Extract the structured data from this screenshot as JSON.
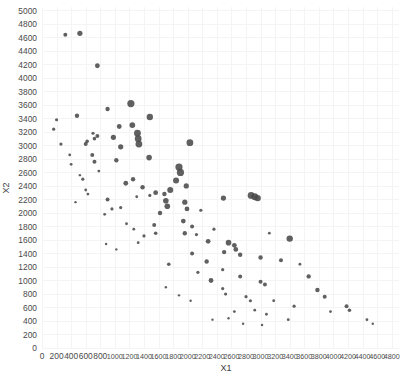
{
  "chart_data": {
    "type": "scatter",
    "title": "",
    "xlabel": "X1",
    "ylabel": "X2",
    "xlim": [
      0,
      4900
    ],
    "ylim": [
      0,
      5050
    ],
    "grid": true,
    "legend": "none",
    "marker_color": "#4a4a4a",
    "background": "#ffffff",
    "gridline_color": "#f4f4f6",
    "xticks": [
      0,
      200,
      400,
      600,
      800,
      1000,
      1200,
      1400,
      1600,
      1800,
      2000,
      2200,
      2400,
      2600,
      2800,
      3000,
      3200,
      3400,
      3600,
      3800,
      4000,
      4200,
      4400,
      4600,
      4800
    ],
    "yticks": [
      0,
      200,
      400,
      600,
      800,
      1000,
      1200,
      1400,
      1600,
      1800,
      2000,
      2200,
      2400,
      2600,
      2800,
      3000,
      3200,
      3400,
      3600,
      3800,
      4000,
      4200,
      4400,
      4600,
      4800,
      5000
    ],
    "points": [
      {
        "x": 320,
        "y": 4640,
        "s": 2.0
      },
      {
        "x": 520,
        "y": 4660,
        "s": 2.6
      },
      {
        "x": 760,
        "y": 4180,
        "s": 2.4
      },
      {
        "x": 200,
        "y": 3380,
        "s": 1.6
      },
      {
        "x": 480,
        "y": 3440,
        "s": 2.2
      },
      {
        "x": 160,
        "y": 3240,
        "s": 1.6
      },
      {
        "x": 260,
        "y": 3020,
        "s": 1.6
      },
      {
        "x": 600,
        "y": 3020,
        "s": 2.0
      },
      {
        "x": 690,
        "y": 2860,
        "s": 2.0
      },
      {
        "x": 720,
        "y": 2760,
        "s": 2.0
      },
      {
        "x": 900,
        "y": 3540,
        "s": 2.2
      },
      {
        "x": 1060,
        "y": 3280,
        "s": 2.4
      },
      {
        "x": 1220,
        "y": 3620,
        "s": 3.6
      },
      {
        "x": 1240,
        "y": 3300,
        "s": 2.8
      },
      {
        "x": 1480,
        "y": 3420,
        "s": 3.2
      },
      {
        "x": 700,
        "y": 3180,
        "s": 1.6
      },
      {
        "x": 760,
        "y": 3140,
        "s": 2.0
      },
      {
        "x": 720,
        "y": 3100,
        "s": 1.8
      },
      {
        "x": 620,
        "y": 3060,
        "s": 1.8
      },
      {
        "x": 980,
        "y": 3120,
        "s": 2.6
      },
      {
        "x": 1080,
        "y": 2980,
        "s": 2.6
      },
      {
        "x": 1310,
        "y": 3180,
        "s": 3.4
      },
      {
        "x": 1320,
        "y": 3100,
        "s": 3.4
      },
      {
        "x": 1330,
        "y": 3020,
        "s": 3.4
      },
      {
        "x": 1470,
        "y": 2820,
        "s": 2.8
      },
      {
        "x": 2030,
        "y": 3040,
        "s": 3.4
      },
      {
        "x": 1020,
        "y": 2780,
        "s": 2.2
      },
      {
        "x": 380,
        "y": 2860,
        "s": 1.4
      },
      {
        "x": 400,
        "y": 2720,
        "s": 1.4
      },
      {
        "x": 560,
        "y": 2500,
        "s": 1.6
      },
      {
        "x": 600,
        "y": 2340,
        "s": 1.4
      },
      {
        "x": 630,
        "y": 2280,
        "s": 1.4
      },
      {
        "x": 1150,
        "y": 2440,
        "s": 2.4
      },
      {
        "x": 1250,
        "y": 2500,
        "s": 2.2
      },
      {
        "x": 1380,
        "y": 2380,
        "s": 2.2
      },
      {
        "x": 1560,
        "y": 2300,
        "s": 2.4
      },
      {
        "x": 1680,
        "y": 2280,
        "s": 2.2
      },
      {
        "x": 900,
        "y": 2200,
        "s": 2.0
      },
      {
        "x": 1080,
        "y": 2080,
        "s": 1.6
      },
      {
        "x": 860,
        "y": 1980,
        "s": 1.4
      },
      {
        "x": 960,
        "y": 2060,
        "s": 1.6
      },
      {
        "x": 1880,
        "y": 2680,
        "s": 3.6
      },
      {
        "x": 1900,
        "y": 2600,
        "s": 3.6
      },
      {
        "x": 1840,
        "y": 2480,
        "s": 3.0
      },
      {
        "x": 1760,
        "y": 2340,
        "s": 3.0
      },
      {
        "x": 1980,
        "y": 2400,
        "s": 2.6
      },
      {
        "x": 1700,
        "y": 2180,
        "s": 2.8
      },
      {
        "x": 1720,
        "y": 2100,
        "s": 2.8
      },
      {
        "x": 1960,
        "y": 2160,
        "s": 2.6
      },
      {
        "x": 1990,
        "y": 2060,
        "s": 2.4
      },
      {
        "x": 1620,
        "y": 2000,
        "s": 2.2
      },
      {
        "x": 1940,
        "y": 1880,
        "s": 2.4
      },
      {
        "x": 2060,
        "y": 1800,
        "s": 2.0
      },
      {
        "x": 1960,
        "y": 1700,
        "s": 2.2
      },
      {
        "x": 1540,
        "y": 1820,
        "s": 2.0
      },
      {
        "x": 1560,
        "y": 1700,
        "s": 1.8
      },
      {
        "x": 1400,
        "y": 1660,
        "s": 1.6
      },
      {
        "x": 2870,
        "y": 2260,
        "s": 3.4
      },
      {
        "x": 2920,
        "y": 2240,
        "s": 3.4
      },
      {
        "x": 2960,
        "y": 2220,
        "s": 3.2
      },
      {
        "x": 2490,
        "y": 2220,
        "s": 2.6
      },
      {
        "x": 3400,
        "y": 1620,
        "s": 3.2
      },
      {
        "x": 2560,
        "y": 1560,
        "s": 2.8
      },
      {
        "x": 2640,
        "y": 1520,
        "s": 2.4
      },
      {
        "x": 2660,
        "y": 1460,
        "s": 2.4
      },
      {
        "x": 2280,
        "y": 1580,
        "s": 2.4
      },
      {
        "x": 2500,
        "y": 1420,
        "s": 2.2
      },
      {
        "x": 2720,
        "y": 1380,
        "s": 2.2
      },
      {
        "x": 2060,
        "y": 1400,
        "s": 2.0
      },
      {
        "x": 2260,
        "y": 1280,
        "s": 2.2
      },
      {
        "x": 3000,
        "y": 1340,
        "s": 2.2
      },
      {
        "x": 3280,
        "y": 1300,
        "s": 2.0
      },
      {
        "x": 1740,
        "y": 1240,
        "s": 1.8
      },
      {
        "x": 2140,
        "y": 1120,
        "s": 1.6
      },
      {
        "x": 2480,
        "y": 1160,
        "s": 1.6
      },
      {
        "x": 2720,
        "y": 1060,
        "s": 2.0
      },
      {
        "x": 3000,
        "y": 980,
        "s": 2.0
      },
      {
        "x": 3060,
        "y": 940,
        "s": 2.0
      },
      {
        "x": 2320,
        "y": 1000,
        "s": 2.4
      },
      {
        "x": 3660,
        "y": 1060,
        "s": 2.2
      },
      {
        "x": 3780,
        "y": 860,
        "s": 2.2
      },
      {
        "x": 3880,
        "y": 760,
        "s": 2.0
      },
      {
        "x": 2480,
        "y": 880,
        "s": 1.6
      },
      {
        "x": 2520,
        "y": 800,
        "s": 1.6
      },
      {
        "x": 2800,
        "y": 760,
        "s": 1.6
      },
      {
        "x": 2860,
        "y": 700,
        "s": 1.6
      },
      {
        "x": 3180,
        "y": 700,
        "s": 1.4
      },
      {
        "x": 3460,
        "y": 620,
        "s": 1.6
      },
      {
        "x": 2920,
        "y": 560,
        "s": 1.4
      },
      {
        "x": 3080,
        "y": 500,
        "s": 1.4
      },
      {
        "x": 2640,
        "y": 540,
        "s": 1.4
      },
      {
        "x": 2560,
        "y": 440,
        "s": 1.2
      },
      {
        "x": 2340,
        "y": 420,
        "s": 1.2
      },
      {
        "x": 2760,
        "y": 360,
        "s": 1.2
      },
      {
        "x": 3020,
        "y": 340,
        "s": 1.2
      },
      {
        "x": 3380,
        "y": 420,
        "s": 1.4
      },
      {
        "x": 3960,
        "y": 540,
        "s": 1.4
      },
      {
        "x": 4180,
        "y": 620,
        "s": 2.0
      },
      {
        "x": 4220,
        "y": 560,
        "s": 1.8
      },
      {
        "x": 4460,
        "y": 420,
        "s": 1.4
      },
      {
        "x": 4540,
        "y": 360,
        "s": 1.2
      },
      {
        "x": 1160,
        "y": 1840,
        "s": 1.4
      },
      {
        "x": 1260,
        "y": 1760,
        "s": 1.4
      },
      {
        "x": 1320,
        "y": 1560,
        "s": 1.4
      },
      {
        "x": 880,
        "y": 1540,
        "s": 1.2
      },
      {
        "x": 1020,
        "y": 1460,
        "s": 1.2
      },
      {
        "x": 1700,
        "y": 900,
        "s": 1.2
      },
      {
        "x": 1880,
        "y": 780,
        "s": 1.2
      },
      {
        "x": 2040,
        "y": 700,
        "s": 1.2
      },
      {
        "x": 1480,
        "y": 2260,
        "s": 1.6
      },
      {
        "x": 1300,
        "y": 2240,
        "s": 1.4
      },
      {
        "x": 780,
        "y": 2620,
        "s": 1.4
      },
      {
        "x": 520,
        "y": 2560,
        "s": 1.2
      },
      {
        "x": 460,
        "y": 2160,
        "s": 1.2
      },
      {
        "x": 2180,
        "y": 2040,
        "s": 1.6
      },
      {
        "x": 2120,
        "y": 1680,
        "s": 1.6
      },
      {
        "x": 2360,
        "y": 1760,
        "s": 1.6
      },
      {
        "x": 3120,
        "y": 1700,
        "s": 1.4
      },
      {
        "x": 3540,
        "y": 1240,
        "s": 1.4
      }
    ]
  },
  "axes": {
    "x_title": "X1",
    "y_title": "X2"
  }
}
